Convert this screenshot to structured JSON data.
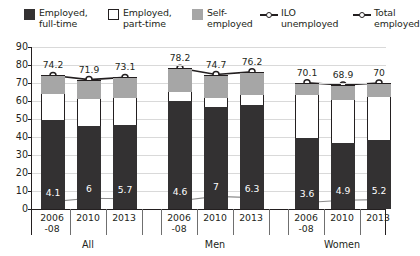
{
  "legend": {
    "items": [
      {
        "label": "Employed,\nfull-time",
        "icon": "square-swatch-dark",
        "color": "#333132",
        "type": "swatch"
      },
      {
        "label": "Employed,\npart-time",
        "icon": "square-swatch-white",
        "color": "#ffffff",
        "type": "swatch"
      },
      {
        "label": "Self-\nemployed",
        "icon": "square-swatch-grey",
        "color": "#a6a6a6",
        "type": "swatch"
      },
      {
        "label": "ILO\nunemployed",
        "icon": "line-open-marker",
        "color": "#231f20",
        "type": "line"
      },
      {
        "label": "Total\nemployed",
        "icon": "line-diamond-marker",
        "color": "#231f20",
        "type": "line"
      }
    ]
  },
  "chart_data": {
    "type": "bar",
    "title": "",
    "xlabel": "",
    "ylabel": "",
    "ylim": [
      0,
      90
    ],
    "yticks": [
      0,
      10,
      20,
      30,
      40,
      50,
      60,
      70,
      80,
      90
    ],
    "grid": true,
    "legend_position": "top",
    "groups": [
      "All",
      "Men",
      "Women"
    ],
    "categories": [
      "2006\n-08",
      "2010",
      "2013"
    ],
    "stacked_series": [
      {
        "name": "Employed, full-time",
        "color": "#333132",
        "values": {
          "All": [
            49.7,
            46.3,
            46.9
          ],
          "Men": [
            59.9,
            56.6,
            57.9
          ],
          "Women": [
            39.2,
            36.4,
            38.5
          ]
        }
      },
      {
        "name": "Employed, part-time",
        "color": "#ffffff",
        "values": {
          "All": [
            14.3,
            14.6,
            14.9
          ],
          "Men": [
            5.0,
            5.3,
            5.5
          ],
          "Women": [
            23.9,
            24.3,
            23.9
          ]
        }
      },
      {
        "name": "Self-employed",
        "color": "#a6a6a6",
        "values": {
          "All": [
            10.2,
            11.0,
            11.3
          ],
          "Men": [
            13.3,
            12.8,
            12.8
          ],
          "Women": [
            7.0,
            8.2,
            7.6
          ]
        }
      }
    ],
    "line_series": [
      {
        "name": "Total employed",
        "marker": "open-circle",
        "color": "#231f20",
        "values": {
          "All": [
            74.2,
            71.9,
            73.1
          ],
          "Men": [
            78.2,
            74.7,
            76.2
          ],
          "Women": [
            70.1,
            68.9,
            70.0
          ]
        },
        "labels": {
          "All": [
            "74.2",
            "71.9",
            "73.1"
          ],
          "Men": [
            "78.2",
            "74.7",
            "76.2"
          ],
          "Women": [
            "70.1",
            "68.9",
            "70"
          ]
        }
      },
      {
        "name": "ILO unemployed",
        "marker": "small-white-square",
        "color": "#8c8c8c",
        "values": {
          "All": [
            4.1,
            6.0,
            5.7
          ],
          "Men": [
            4.6,
            7.0,
            6.3
          ],
          "Women": [
            3.6,
            4.9,
            5.2
          ]
        },
        "labels": {
          "All": [
            "4.1",
            "6",
            "5.7"
          ],
          "Men": [
            "4.6",
            "7",
            "6.3"
          ],
          "Women": [
            "3.6",
            "4.9",
            "5.2"
          ]
        }
      }
    ]
  }
}
